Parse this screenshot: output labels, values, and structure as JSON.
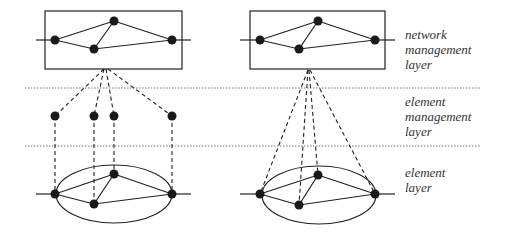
{
  "diagram": {
    "layers": [
      {
        "id": "network-management",
        "lines": [
          "network",
          "management",
          "layer"
        ]
      },
      {
        "id": "element-management",
        "lines": [
          "element",
          "management",
          "layer"
        ]
      },
      {
        "id": "element",
        "lines": [
          "element",
          "layer"
        ]
      }
    ],
    "colors": {
      "stroke": "#222222",
      "node": "#1a1a1a",
      "divider": "#777777"
    }
  }
}
